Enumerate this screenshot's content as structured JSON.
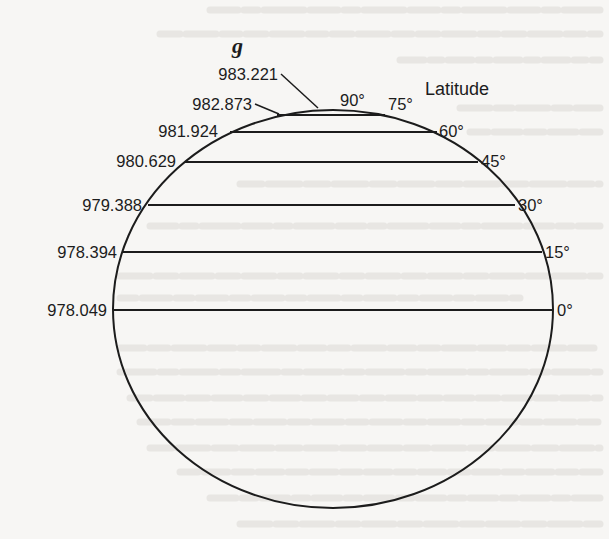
{
  "figure": {
    "axis_symbol": "g",
    "latitude_title": "Latitude",
    "colors": {
      "ink": "#1c1c1c",
      "paper": "#f7f6f4",
      "bleed": "#d9d7d3"
    },
    "parallels": [
      {
        "latitude": "90°",
        "gravity": "983.221"
      },
      {
        "latitude": "75°",
        "gravity": "982.873"
      },
      {
        "latitude": "60°",
        "gravity": "981.924"
      },
      {
        "latitude": "45°",
        "gravity": "980.629"
      },
      {
        "latitude": "30°",
        "gravity": "979.388"
      },
      {
        "latitude": "15°",
        "gravity": "978.394"
      },
      {
        "latitude": "0°",
        "gravity": "978.049"
      }
    ]
  }
}
